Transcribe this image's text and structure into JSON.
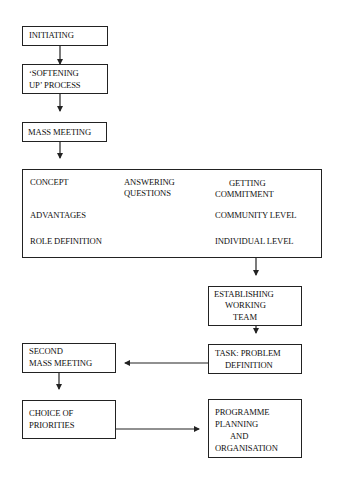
{
  "diagram": {
    "type": "flowchart",
    "nodes": {
      "initiating": {
        "lines": [
          "INITIATING"
        ]
      },
      "softening": {
        "lines": [
          "‘SOFTENING",
          "UP’  PROCESS"
        ]
      },
      "mass_meeting": {
        "lines": [
          "MASS MEETING"
        ]
      },
      "big_box": {
        "concept": "CONCEPT",
        "advantages": "ADVANTAGES",
        "role_definition": "ROLE DEFINITION",
        "answering": [
          "ANSWERING",
          "QUESTIONS"
        ],
        "getting": [
          "GETTING",
          "COMMITMENT"
        ],
        "community_level": "COMMUNITY LEVEL",
        "individual_level": "INDIVIDUAL LEVEL"
      },
      "establishing": {
        "lines": [
          "ESTABLISHING",
          "WORKING",
          "TEAM"
        ]
      },
      "task": {
        "lines": [
          "TASK: PROBLEM",
          "DEFINITION"
        ]
      },
      "second_mass": {
        "lines": [
          "SECOND",
          "MASS MEETING"
        ]
      },
      "choice": {
        "lines": [
          "CHOICE OF",
          "PRIORITIES"
        ]
      },
      "programme": {
        "lines": [
          "PROGRAMME",
          "PLANNING",
          "AND",
          "ORGANISATION"
        ]
      }
    },
    "edges": [
      {
        "from": "initiating",
        "to": "softening"
      },
      {
        "from": "softening",
        "to": "mass_meeting"
      },
      {
        "from": "mass_meeting",
        "to": "big_box"
      },
      {
        "from": "big_box",
        "to": "establishing"
      },
      {
        "from": "establishing",
        "to": "task"
      },
      {
        "from": "task",
        "to": "second_mass"
      },
      {
        "from": "second_mass",
        "to": "choice"
      },
      {
        "from": "choice",
        "to": "programme"
      }
    ],
    "colors": {
      "line": "#222222",
      "background": "#ffffff"
    }
  }
}
